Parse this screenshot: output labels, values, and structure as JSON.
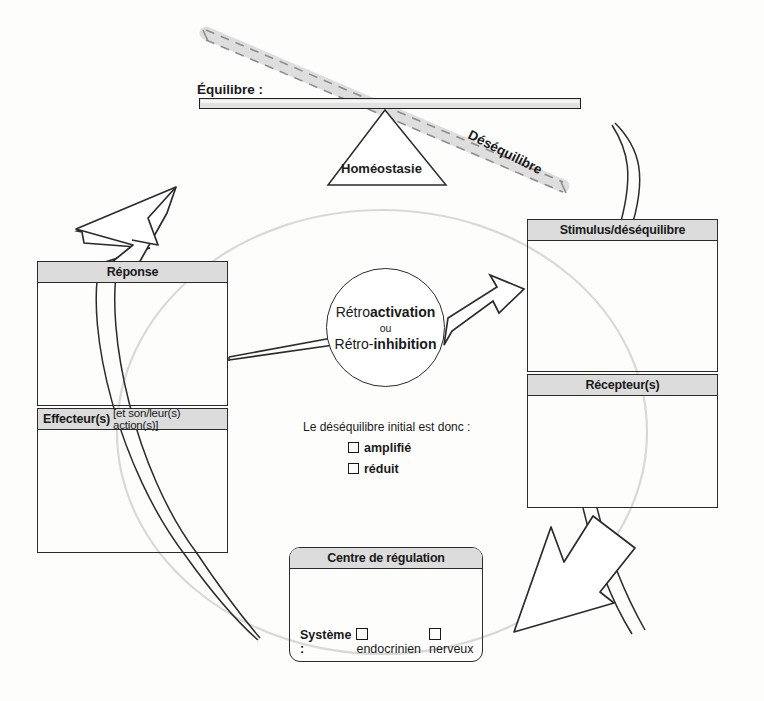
{
  "diagram": {
    "balance": {
      "equilibre_label": "Équilibre :",
      "desequilibre_label": "Déséquilibre",
      "homeostasie_label": "Homéostasie"
    },
    "boxes": {
      "reponse": {
        "title": "Réponse",
        "subtitle": ""
      },
      "effecteur": {
        "title": "Effecteur(s)",
        "subtitle": "[et son/leur(s) action(s)]"
      },
      "stimulus": {
        "title": "Stimulus/déséquilibre",
        "subtitle": ""
      },
      "recepteur": {
        "title": "Récepteur(s)",
        "subtitle": ""
      },
      "centre": {
        "title": "Centre de régulation",
        "systeme_label": "Système :",
        "options": [
          "endocrinien",
          "nerveux"
        ]
      }
    },
    "circle": {
      "line1_prefix": "Rétro",
      "line1_bold": "activation",
      "line2": "ou",
      "line3_prefix": "Rétro-",
      "line3_bold": "inhibition"
    },
    "question": {
      "prompt": "Le déséquilibre initial est donc :",
      "options": [
        "amplifié",
        "réduit"
      ]
    },
    "colors": {
      "stroke": "#2b2b2b",
      "header_fill": "#dcdcdc",
      "beam_fill": "#e2e2e2",
      "dashed_beam": "#d8d8d8",
      "faint_circle": "#dadada"
    }
  }
}
